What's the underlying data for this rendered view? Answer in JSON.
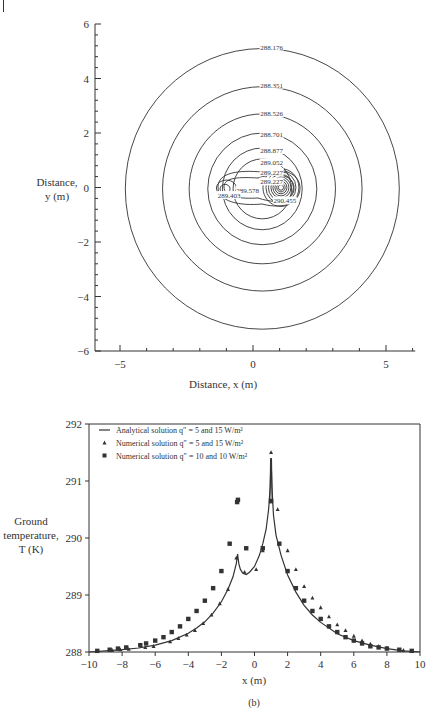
{
  "chart_data": [
    {
      "panel": "(a)",
      "type": "contour",
      "xlabel": "Distance, x (m)",
      "ylabel_line1": "Distance,",
      "ylabel_line2": "y (m)",
      "xlim": [
        -6,
        6.1
      ],
      "ylim": [
        -6,
        6
      ],
      "x_ticks": [
        -5,
        0,
        5
      ],
      "y_ticks": [
        -6,
        -4,
        -2,
        0,
        2,
        4,
        6
      ],
      "x_tick_labels": [
        "−5",
        "0",
        "5"
      ],
      "y_tick_labels": [
        "−6",
        "−4",
        "−2",
        "0",
        "2",
        "4",
        "6"
      ],
      "contour_levels": [
        288.176,
        288.351,
        288.526,
        288.701,
        288.877,
        289.052,
        289.227,
        289.227,
        289.578,
        289.403,
        290.455
      ],
      "contour_labels": [
        {
          "text": "288.176",
          "x": 0.7,
          "y": 5.1
        },
        {
          "text": "288.351",
          "x": 0.7,
          "y": 3.7
        },
        {
          "text": "288.526",
          "x": 0.7,
          "y": 2.65
        },
        {
          "text": "288.701",
          "x": 0.7,
          "y": 1.9
        },
        {
          "text": "288.877",
          "x": 0.7,
          "y": 1.3
        },
        {
          "text": "289.052",
          "x": 0.7,
          "y": 0.85
        },
        {
          "text": "289.227",
          "x": 0.7,
          "y": 0.5
        },
        {
          "text": "289.227",
          "x": 0.7,
          "y": 0.15
        },
        {
          "text": "289.578",
          "x": -0.2,
          "y": -0.15
        },
        {
          "text": "289.403",
          "x": -0.9,
          "y": -0.35
        },
        {
          "text": "290.455",
          "x": 1.2,
          "y": -0.55
        }
      ],
      "sources": [
        {
          "x": -1,
          "y": 0,
          "q": "5 W/m2"
        },
        {
          "x": 1,
          "y": 0,
          "q": "15 W/m2"
        }
      ],
      "grid": false
    },
    {
      "panel": "(b)",
      "type": "line",
      "xlabel": "x (m)",
      "ylabel_line1": "Ground",
      "ylabel_line2": "temperature,",
      "ylabel_line3": "T (K)",
      "xlim": [
        -10,
        10
      ],
      "ylim": [
        288,
        292
      ],
      "x_ticks": [
        -10,
        -8,
        -6,
        -4,
        -2,
        0,
        2,
        4,
        6,
        8,
        10
      ],
      "x_tick_labels": [
        "−10",
        "−8",
        "−6",
        "−4",
        "−2",
        "0",
        "2",
        "4",
        "6",
        "8",
        "10"
      ],
      "y_ticks": [
        288,
        289,
        290,
        291,
        292
      ],
      "y_tick_labels": [
        "288",
        "289",
        "290",
        "291",
        "292"
      ],
      "legend_position": "upper left",
      "grid": false,
      "series": [
        {
          "name": "Analytical solution q″ = 5 and 15 W/m²",
          "style": "line",
          "x": [
            -10,
            -9,
            -8,
            -7,
            -6,
            -5,
            -4,
            -3.5,
            -3,
            -2.5,
            -2,
            -1.6,
            -1.3,
            -1.1,
            -1.02,
            -0.95,
            -0.85,
            -0.7,
            -0.5,
            -0.3,
            0,
            0.3,
            0.5,
            0.7,
            0.85,
            0.95,
            1.0,
            1.05,
            1.15,
            1.3,
            1.6,
            2,
            2.5,
            3,
            3.5,
            4,
            5,
            6,
            7,
            8,
            9,
            10
          ],
          "y": [
            288.0,
            288.02,
            288.04,
            288.07,
            288.12,
            288.2,
            288.33,
            288.42,
            288.53,
            288.68,
            288.88,
            289.1,
            289.32,
            289.55,
            289.72,
            289.55,
            289.45,
            289.38,
            289.36,
            289.4,
            289.5,
            289.7,
            289.9,
            290.15,
            290.5,
            290.9,
            291.4,
            290.9,
            290.4,
            290.05,
            289.7,
            289.35,
            289.05,
            288.82,
            288.65,
            288.52,
            288.32,
            288.2,
            288.12,
            288.06,
            288.02,
            288.0
          ]
        },
        {
          "name": "Numerical solution q″ = 5 and 15 W/m²",
          "style": "triangle",
          "x": [
            -9.5,
            -8.6,
            -8.1,
            -7.6,
            -6.6,
            -6.1,
            -5.1,
            -4.6,
            -4.1,
            -3.6,
            -3.1,
            -2.6,
            -2.1,
            -1.6,
            -1.1,
            -0.6,
            0.1,
            0.5,
            1.0,
            1.4,
            2.0,
            2.5,
            3.0,
            3.5,
            4.0,
            4.5,
            5.0,
            5.5,
            6.0,
            6.5,
            7.0,
            7.5,
            8.0,
            9.0,
            9.5
          ],
          "y": [
            288.01,
            288.03,
            288.04,
            288.05,
            288.08,
            288.1,
            288.18,
            288.24,
            288.3,
            288.38,
            288.5,
            288.65,
            288.85,
            289.1,
            289.65,
            289.4,
            289.45,
            289.78,
            291.5,
            290.5,
            289.78,
            289.45,
            289.15,
            288.95,
            288.78,
            288.62,
            288.48,
            288.38,
            288.28,
            288.2,
            288.14,
            288.1,
            288.07,
            288.03,
            288.01
          ]
        },
        {
          "name": "Numerical solution q″ = 10 and 10 W/m²",
          "style": "square",
          "x": [
            -9.5,
            -8.75,
            -8.25,
            -7.75,
            -6.9,
            -6.55,
            -6.0,
            -5.5,
            -5.0,
            -4.5,
            -4.0,
            -3.5,
            -3.0,
            -2.5,
            -2.0,
            -1.5,
            -1.05,
            -1.0,
            -0.5,
            0.5,
            1.0,
            1.5,
            2.0,
            2.5,
            3.0,
            3.5,
            4.0,
            4.5,
            5.0,
            5.5,
            6.0,
            6.5,
            7.0,
            7.5,
            8.0,
            8.75,
            9.5
          ],
          "y": [
            288.02,
            288.04,
            288.06,
            288.08,
            288.12,
            288.15,
            288.2,
            288.26,
            288.35,
            288.45,
            288.58,
            288.72,
            288.9,
            289.12,
            289.42,
            289.9,
            290.63,
            290.67,
            289.82,
            289.82,
            290.65,
            289.9,
            289.42,
            289.12,
            288.9,
            288.72,
            288.58,
            288.45,
            288.35,
            288.26,
            288.2,
            288.15,
            288.1,
            288.08,
            288.06,
            288.04,
            288.02
          ]
        }
      ]
    }
  ],
  "panel_a": {
    "caption": "(a)",
    "xlabel": "Distance, x (m)",
    "ylabel_line1": "Distance,",
    "ylabel_line2": "y (m)"
  },
  "panel_b": {
    "caption": "(b)",
    "xlabel": "x (m)",
    "ylabel_line1": "Ground",
    "ylabel_line2": "temperature,",
    "ylabel_line3": "T (K)",
    "legend": [
      {
        "label": "Analytical solution q″ = 5 and 15 W/m²",
        "marker": "line"
      },
      {
        "label": "Numerical solution q″ = 5 and 15 W/m²",
        "marker": "triangle"
      },
      {
        "label": "Numerical solution q″ = 10 and 10 W/m²",
        "marker": "square"
      }
    ]
  },
  "colors": {
    "ink": "#333333",
    "background": "#ffffff"
  }
}
